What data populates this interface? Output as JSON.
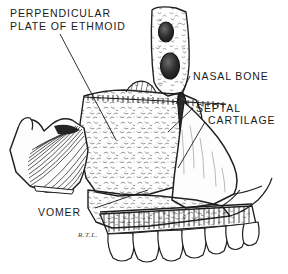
{
  "figure": {
    "medium": "pen-and-ink line drawing",
    "background_color": "#ffffff",
    "ink_color": "#1a1a1a",
    "width": 288,
    "height": 274
  },
  "labels": {
    "perpendicular_plate": {
      "line1": "PERPENDICULAR",
      "line2": "PLATE OF ETHMOID"
    },
    "nasal_bone": "NASAL BONE",
    "septal_cartilage": {
      "line1": "SEPTAL",
      "line2": "CARTILAGE"
    },
    "vomer": "VOMER"
  },
  "signature": "R.T.L.",
  "structures": [
    {
      "name": "frontal-process",
      "note": "upper vertical bar with two dark oval foramina"
    },
    {
      "name": "ethmoid-perpendicular-plate",
      "note": "stippled bone plate, central upper"
    },
    {
      "name": "nasal-bone",
      "note": "narrow dark sliver at anterior margin"
    },
    {
      "name": "septal-cartilage",
      "note": "large smooth quadrilateral anterior plate"
    },
    {
      "name": "vomer",
      "note": "stippled triangular bone, lower central"
    },
    {
      "name": "sphenoid-pterygoid",
      "note": "hooked process with radiating hatching, left"
    },
    {
      "name": "maxillary-alveolar-ridge",
      "note": "comb-hatched palate margin"
    },
    {
      "name": "teeth",
      "note": "row of seven upper teeth along lower border"
    },
    {
      "name": "suture-line",
      "note": "serrated cross-hatched suture band"
    }
  ]
}
